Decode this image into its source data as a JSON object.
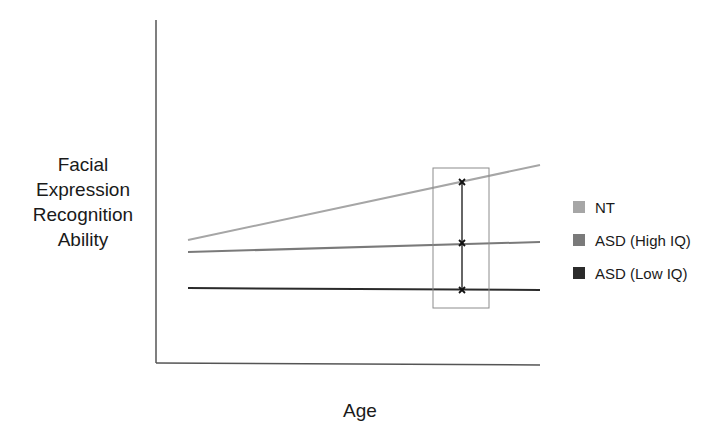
{
  "chart_data": {
    "type": "line",
    "title": "",
    "xlabel": "Age",
    "ylabel": "Facial Expression Recognition Ability",
    "ylabel_lines": [
      "Facial",
      "Expression",
      "Recognition",
      "Ability"
    ],
    "x_ticks": [],
    "y_ticks": [],
    "grid": false,
    "legend_position": "right",
    "x": [
      0,
      1
    ],
    "series": [
      {
        "name": "NT",
        "color": "#a6a6a6",
        "values": [
          0.36,
          0.58
        ],
        "px": [
          [
            188,
            240
          ],
          [
            540,
            165
          ]
        ]
      },
      {
        "name": "ASD (High IQ)",
        "color": "#7a7a7a",
        "values": [
          0.33,
          0.36
        ],
        "px": [
          [
            188,
            252
          ],
          [
            540,
            242
          ]
        ]
      },
      {
        "name": "ASD (Low IQ)",
        "color": "#2b2b2b",
        "values": [
          0.22,
          0.215
        ],
        "px": [
          [
            188,
            288
          ],
          [
            540,
            290
          ]
        ]
      }
    ],
    "annotations": {
      "highlight_box": {
        "x0": 433,
        "y0": 168,
        "x1": 489,
        "y1": 308,
        "color": "#8c8c8c"
      },
      "markers_x": 462,
      "markers": [
        {
          "series": "NT",
          "y": 182
        },
        {
          "series": "ASD (High IQ)",
          "y": 243
        },
        {
          "series": "ASD (Low IQ)",
          "y": 290
        }
      ],
      "connector": "vertical line linking markers at the same age"
    }
  },
  "axes": {
    "x_label": "Age",
    "y_label_lines": [
      "Facial",
      "Expression",
      "Recognition",
      "Ability"
    ]
  },
  "legend": [
    {
      "label": "NT",
      "color": "#a6a6a6"
    },
    {
      "label": "ASD (High IQ)",
      "color": "#7a7a7a"
    },
    {
      "label": "ASD (Low IQ)",
      "color": "#2b2b2b"
    }
  ]
}
